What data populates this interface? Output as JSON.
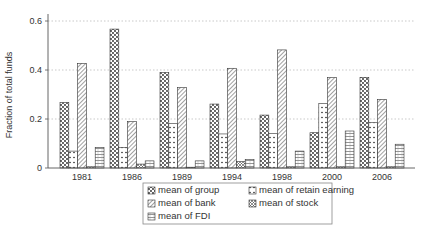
{
  "chart_data": {
    "type": "bar",
    "title": "",
    "xlabel": "",
    "ylabel": "Fraction of total funds",
    "ylim": [
      0,
      0.65
    ],
    "yticks": [
      0,
      0.2,
      0.4,
      0.6
    ],
    "ytick_labels": [
      "0",
      "0.2",
      "0.4",
      "0.6"
    ],
    "grid": "horizontal-dotted",
    "categories": [
      "1981",
      "1986",
      "1989",
      "1994",
      "1998",
      "2000",
      "2006"
    ],
    "series": [
      {
        "name": "mean of group",
        "pattern": "dense-dots",
        "values": [
          0.267,
          0.567,
          0.39,
          0.261,
          0.216,
          0.144,
          0.37
        ]
      },
      {
        "name": "mean of retain earning",
        "pattern": "sparse-dots",
        "values": [
          0.069,
          0.084,
          0.182,
          0.139,
          0.141,
          0.264,
          0.185
        ]
      },
      {
        "name": "mean of bank",
        "pattern": "diagonal-hatch",
        "values": [
          0.427,
          0.189,
          0.328,
          0.407,
          0.482,
          0.369,
          0.28
        ]
      },
      {
        "name": "mean of stock",
        "pattern": "crosshatch",
        "values": [
          0.005,
          0.016,
          0.0,
          0.026,
          0.005,
          0.005,
          0.005
        ]
      },
      {
        "name": "mean of FDI",
        "pattern": "horizontal-lines",
        "values": [
          0.084,
          0.029,
          0.029,
          0.035,
          0.069,
          0.151,
          0.097
        ]
      }
    ],
    "legend": {
      "placement": "bottom-center",
      "columns": 2,
      "entries": [
        "mean of group",
        "mean of retain earning",
        "mean of bank",
        "mean of stock",
        "mean of FDI"
      ]
    },
    "colors": {
      "bar_edge": "#333333",
      "grid": "#bbbbbb",
      "axis": "#555555"
    }
  }
}
